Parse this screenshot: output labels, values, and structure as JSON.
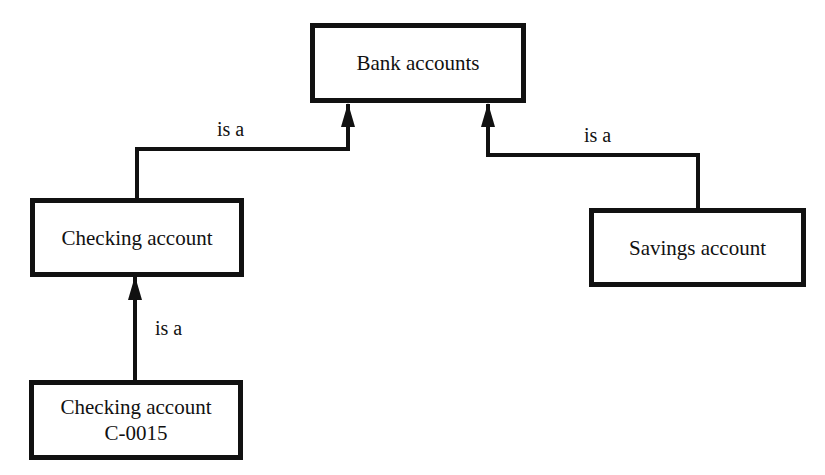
{
  "diagram": {
    "type": "class-hierarchy",
    "nodes": [
      {
        "id": "bank-accounts",
        "lines": [
          "Bank accounts"
        ]
      },
      {
        "id": "checking-account",
        "lines": [
          "Checking account"
        ]
      },
      {
        "id": "savings-account",
        "lines": [
          "Savings account"
        ]
      },
      {
        "id": "checking-c0015",
        "lines": [
          "Checking account",
          "C-0015"
        ]
      }
    ],
    "edges": [
      {
        "from": "checking-account",
        "to": "bank-accounts",
        "label": "is a"
      },
      {
        "from": "savings-account",
        "to": "bank-accounts",
        "label": "is a"
      },
      {
        "from": "checking-c0015",
        "to": "checking-account",
        "label": "is a"
      }
    ]
  }
}
